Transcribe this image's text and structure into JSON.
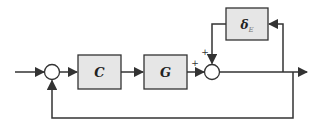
{
  "diagram": {
    "type": "control-block-diagram",
    "colors": {
      "line": "#333333",
      "block_fill": "#e6e6e6",
      "block_stroke": "#333333",
      "junction_fill": "#ffffff"
    },
    "blocks": [
      {
        "id": "controller",
        "label": "C"
      },
      {
        "id": "plant",
        "label": "G"
      },
      {
        "id": "uncertainty",
        "label": "δ",
        "subscript": "E"
      }
    ],
    "junctions": [
      {
        "id": "feedback-sum",
        "signs": []
      },
      {
        "id": "output-sum",
        "signs": [
          "+",
          "+"
        ]
      }
    ],
    "signs": {
      "plant_input_sign": "+",
      "uncertainty_input_sign": "+"
    }
  }
}
